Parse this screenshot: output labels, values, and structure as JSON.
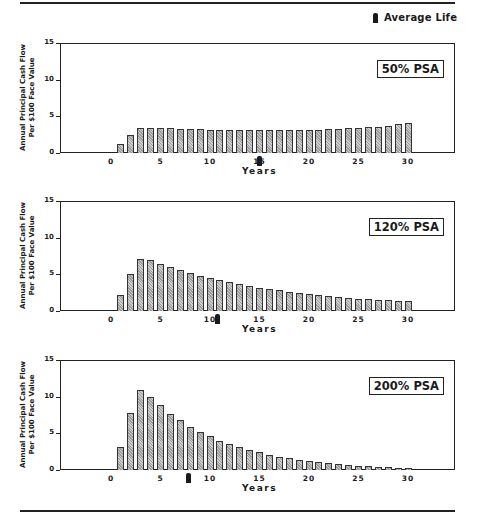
{
  "legend": {
    "label": "Average Life",
    "icon": "average-life-marker-icon"
  },
  "shared": {
    "ylabel_line1": "Annual Principal Cash Flow",
    "ylabel_line2": "Per $100 Face Value",
    "xlabel": "Years",
    "yticks": [
      "15",
      "10",
      "5",
      "0"
    ],
    "xticks": [
      "0",
      "5",
      "10",
      "15",
      "20",
      "25",
      "30"
    ]
  },
  "charts": [
    {
      "label": "50% PSA",
      "average_life": 15.0
    },
    {
      "label": "120% PSA",
      "average_life": 10.8
    },
    {
      "label": "200% PSA",
      "average_life": 7.8
    }
  ],
  "chart_data": [
    {
      "type": "bar",
      "title": "50% PSA",
      "xlabel": "Years",
      "ylabel": "Annual Principal Cash Flow Per $100 Face Value",
      "ylim": [
        0,
        15
      ],
      "xlim": [
        -5,
        34
      ],
      "yticks": [
        0,
        5,
        10,
        15
      ],
      "xticks": [
        0,
        5,
        10,
        15,
        20,
        25,
        30
      ],
      "grid": false,
      "legend": {
        "entries": [
          "Average Life"
        ],
        "position": "top-right"
      },
      "annotations": [
        {
          "type": "average-life-marker",
          "x": 15.0
        }
      ],
      "categories": [
        1,
        2,
        3,
        4,
        5,
        6,
        7,
        8,
        9,
        10,
        11,
        12,
        13,
        14,
        15,
        16,
        17,
        18,
        19,
        20,
        21,
        22,
        23,
        24,
        25,
        26,
        27,
        28,
        29,
        30
      ],
      "values": [
        1.2,
        2.4,
        3.4,
        3.45,
        3.4,
        3.35,
        3.3,
        3.3,
        3.25,
        3.2,
        3.2,
        3.15,
        3.15,
        3.1,
        3.1,
        3.1,
        3.1,
        3.1,
        3.15,
        3.15,
        3.2,
        3.25,
        3.3,
        3.4,
        3.45,
        3.55,
        3.6,
        3.75,
        3.9,
        4.1
      ]
    },
    {
      "type": "bar",
      "title": "120% PSA",
      "xlabel": "Years",
      "ylabel": "Annual Principal Cash Flow Per $100 Face Value",
      "ylim": [
        0,
        15
      ],
      "xlim": [
        -5,
        34
      ],
      "yticks": [
        0,
        5,
        10,
        15
      ],
      "xticks": [
        0,
        5,
        10,
        15,
        20,
        25,
        30
      ],
      "grid": false,
      "annotations": [
        {
          "type": "average-life-marker",
          "x": 10.8
        }
      ],
      "categories": [
        1,
        2,
        3,
        4,
        5,
        6,
        7,
        8,
        9,
        10,
        11,
        12,
        13,
        14,
        15,
        16,
        17,
        18,
        19,
        20,
        21,
        22,
        23,
        24,
        25,
        26,
        27,
        28,
        29,
        30
      ],
      "values": [
        2.2,
        5.0,
        7.1,
        6.9,
        6.4,
        6.0,
        5.6,
        5.2,
        4.8,
        4.5,
        4.2,
        3.9,
        3.65,
        3.4,
        3.2,
        3.0,
        2.8,
        2.6,
        2.5,
        2.3,
        2.2,
        2.0,
        1.9,
        1.8,
        1.7,
        1.6,
        1.5,
        1.45,
        1.4,
        1.3
      ]
    },
    {
      "type": "bar",
      "title": "200% PSA",
      "xlabel": "Years",
      "ylabel": "Annual Principal Cash Flow Per $100 Face Value",
      "ylim": [
        0,
        15
      ],
      "xlim": [
        -5,
        34
      ],
      "yticks": [
        0,
        5,
        10,
        15
      ],
      "xticks": [
        0,
        5,
        10,
        15,
        20,
        25,
        30
      ],
      "grid": false,
      "annotations": [
        {
          "type": "average-life-marker",
          "x": 7.8
        }
      ],
      "categories": [
        1,
        2,
        3,
        4,
        5,
        6,
        7,
        8,
        9,
        10,
        11,
        12,
        13,
        14,
        15,
        16,
        17,
        18,
        19,
        20,
        21,
        22,
        23,
        24,
        25,
        26,
        27,
        28,
        29,
        30
      ],
      "values": [
        3.2,
        7.8,
        10.9,
        10.0,
        8.8,
        7.7,
        6.8,
        5.9,
        5.2,
        4.6,
        4.0,
        3.5,
        3.1,
        2.7,
        2.4,
        2.1,
        1.8,
        1.6,
        1.4,
        1.25,
        1.1,
        0.95,
        0.85,
        0.7,
        0.6,
        0.5,
        0.42,
        0.35,
        0.3,
        0.25
      ]
    }
  ]
}
